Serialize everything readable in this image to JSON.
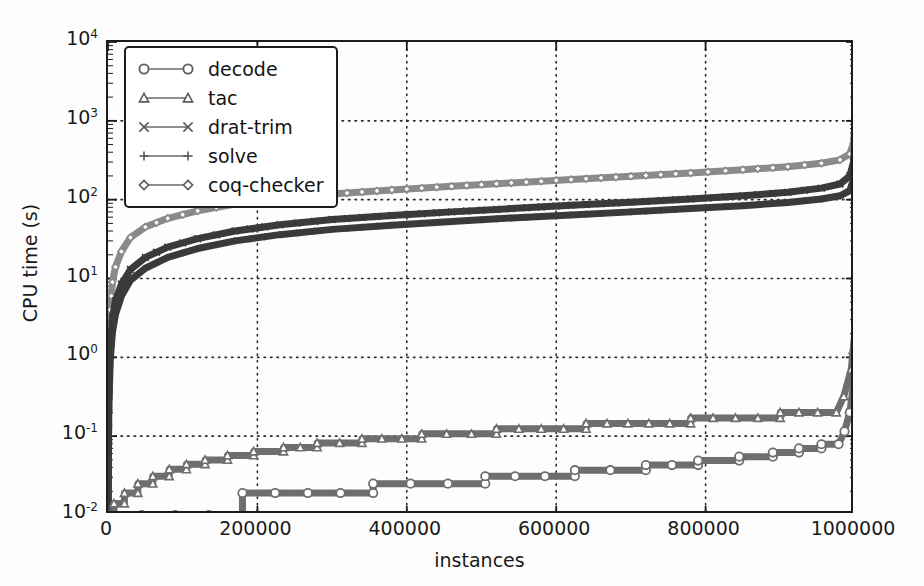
{
  "figure": {
    "yaxis_title": "CPU time (s)",
    "xaxis_title": "instances",
    "background": "#fdfdfd",
    "frame_color": "#1c1c1c"
  },
  "legend": {
    "entries": [
      {
        "label": "decode",
        "marker": "circle-marker",
        "color": "#6e6e6e"
      },
      {
        "label": "tac",
        "marker": "triangle-marker",
        "color": "#6e6e6e"
      },
      {
        "label": "drat-trim",
        "marker": "x-marker",
        "color": "#3a3a3a"
      },
      {
        "label": "solve",
        "marker": "plus-marker",
        "color": "#3a3a3a"
      },
      {
        "label": "coq-checker",
        "marker": "diamond-marker",
        "color": "#8a8a8a"
      }
    ]
  },
  "axes": {
    "y_ticks": [
      {
        "value": 0.01,
        "mantissa": "10",
        "exponent": "-2"
      },
      {
        "value": 0.1,
        "mantissa": "10",
        "exponent": "-1"
      },
      {
        "value": 1,
        "mantissa": "10",
        "exponent": "0"
      },
      {
        "value": 10,
        "mantissa": "10",
        "exponent": "1"
      },
      {
        "value": 100,
        "mantissa": "10",
        "exponent": "2"
      },
      {
        "value": 1000,
        "mantissa": "10",
        "exponent": "3"
      },
      {
        "value": 10000,
        "mantissa": "10",
        "exponent": "4"
      }
    ],
    "x_ticks": [
      {
        "value": 0,
        "label": "0"
      },
      {
        "value": 200000,
        "label": "200000"
      },
      {
        "value": 400000,
        "label": "400000"
      },
      {
        "value": 600000,
        "label": "600000"
      },
      {
        "value": 800000,
        "label": "800000"
      },
      {
        "value": 1000000,
        "label": "1000000"
      }
    ]
  },
  "chart_data": {
    "type": "line",
    "title": "",
    "xlabel": "instances",
    "ylabel": "CPU time (s)",
    "xlim": [
      0,
      1000000
    ],
    "ylim": [
      0.01,
      10000
    ],
    "yscale": "log",
    "xscale": "linear",
    "grid": true,
    "grid_style": "dotted",
    "legend_position": "upper-left",
    "series": [
      {
        "name": "coq-checker",
        "color": "#8a8a8a",
        "marker": "diamond",
        "linewidth": 7,
        "x": [
          0,
          1000,
          3000,
          6000,
          10000,
          18000,
          30000,
          50000,
          80000,
          120000,
          170000,
          230000,
          300000,
          380000,
          460000,
          540000,
          620000,
          700000,
          780000,
          850000,
          910000,
          955000,
          980000,
          993000,
          998000,
          1000000
        ],
        "y": [
          0.012,
          0.9,
          4.0,
          9.0,
          14.0,
          22.0,
          33.0,
          45.0,
          58.0,
          72.0,
          88.0,
          103.0,
          118.0,
          133.0,
          148.0,
          163.0,
          180.0,
          198.0,
          218.0,
          240.0,
          262.0,
          290.0,
          320.0,
          380.0,
          520.0,
          900.0
        ]
      },
      {
        "name": "drat-trim",
        "color": "#3a3a3a",
        "marker": "x",
        "linewidth": 7,
        "x": [
          0,
          1000,
          3000,
          6000,
          10000,
          18000,
          30000,
          50000,
          80000,
          120000,
          170000,
          230000,
          300000,
          380000,
          460000,
          540000,
          620000,
          700000,
          780000,
          850000,
          910000,
          955000,
          980000,
          993000,
          998000,
          1000000
        ],
        "y": [
          0.011,
          0.35,
          1.4,
          3.2,
          5.2,
          8.5,
          13.0,
          18.5,
          25.0,
          32.0,
          40.0,
          48.0,
          56.0,
          63.0,
          70.0,
          77.0,
          85.0,
          93.0,
          102.0,
          112.0,
          124.0,
          140.0,
          158.0,
          200.0,
          300.0,
          560.0
        ]
      },
      {
        "name": "solve",
        "color": "#3a3a3a",
        "marker": "plus",
        "linewidth": 7,
        "x": [
          0,
          1000,
          3000,
          6000,
          10000,
          18000,
          30000,
          50000,
          80000,
          120000,
          170000,
          230000,
          300000,
          380000,
          460000,
          540000,
          620000,
          700000,
          780000,
          850000,
          910000,
          955000,
          980000,
          993000,
          998000,
          1000000
        ],
        "y": [
          0.01,
          0.22,
          0.95,
          2.1,
          3.5,
          6.0,
          9.5,
          13.5,
          18.5,
          24.0,
          30.0,
          36.0,
          42.0,
          47.5,
          53.0,
          58.5,
          64.0,
          70.0,
          77.0,
          84.0,
          92.0,
          102.0,
          112.0,
          130.0,
          180.0,
          330.0
        ]
      },
      {
        "name": "tac",
        "color": "#6e6e6e",
        "marker": "triangle",
        "linewidth": 7,
        "steps": true,
        "x": [
          0,
          8000,
          8000,
          22000,
          22000,
          40000,
          40000,
          60000,
          60000,
          82000,
          82000,
          105000,
          105000,
          130000,
          130000,
          160000,
          160000,
          195000,
          195000,
          235000,
          235000,
          280000,
          280000,
          340000,
          340000,
          420000,
          420000,
          520000,
          520000,
          640000,
          640000,
          780000,
          780000,
          900000,
          900000,
          975000,
          985000,
          995000,
          1000000
        ],
        "y": [
          0.01,
          0.01,
          0.014,
          0.014,
          0.019,
          0.019,
          0.025,
          0.025,
          0.031,
          0.031,
          0.038,
          0.038,
          0.044,
          0.044,
          0.05,
          0.05,
          0.057,
          0.057,
          0.064,
          0.064,
          0.072,
          0.072,
          0.082,
          0.082,
          0.093,
          0.093,
          0.107,
          0.107,
          0.124,
          0.124,
          0.145,
          0.145,
          0.17,
          0.17,
          0.2,
          0.2,
          0.32,
          0.7,
          2.2
        ]
      },
      {
        "name": "decode",
        "color": "#6e6e6e",
        "marker": "circle",
        "linewidth": 7,
        "steps": true,
        "x": [
          0,
          180000,
          180000,
          355000,
          355000,
          505000,
          505000,
          625000,
          625000,
          720000,
          720000,
          790000,
          790000,
          845000,
          845000,
          890000,
          890000,
          925000,
          925000,
          955000,
          955000,
          978000,
          986000,
          993000,
          1000000
        ],
        "y": [
          0.01,
          0.01,
          0.019,
          0.019,
          0.025,
          0.025,
          0.031,
          0.031,
          0.037,
          0.037,
          0.043,
          0.043,
          0.049,
          0.049,
          0.055,
          0.055,
          0.062,
          0.062,
          0.07,
          0.07,
          0.079,
          0.079,
          0.115,
          0.2,
          0.62
        ]
      }
    ]
  }
}
